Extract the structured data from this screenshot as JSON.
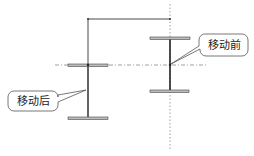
{
  "diagram": {
    "title": "",
    "labels": {
      "before": "移动前",
      "after": "移动后"
    },
    "colors": {
      "line": "#333333",
      "flange_fill": "#bdbdbd",
      "guide": "#888888",
      "callout_border": "#555555"
    },
    "shapes": {
      "before_beam": {
        "web_x": 170,
        "top_y": 38,
        "bottom_y": 91,
        "flange_x1": 150,
        "flange_x2": 190
      },
      "after_beam": {
        "web_x": 88,
        "top_y": 65,
        "bottom_y": 118,
        "flange_x1": 68,
        "flange_x2": 108
      },
      "move_path": {
        "from": [
          170,
          19
        ],
        "corner_right": [
          170,
          19
        ],
        "corner_left": [
          88,
          19
        ],
        "to": [
          88,
          65
        ]
      },
      "horizontal_guide_y": 65,
      "vertical_guide_x": 170
    }
  }
}
